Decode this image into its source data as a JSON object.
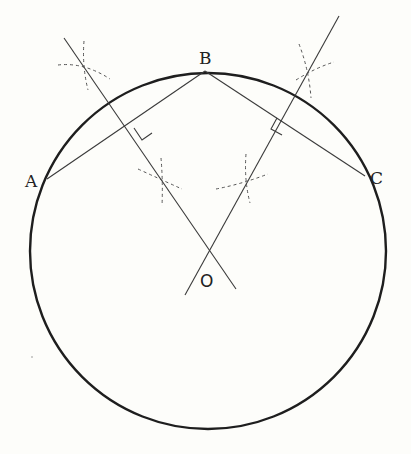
{
  "diagram": {
    "title": "",
    "background": "#fdfdfa",
    "stroke_color": "#2a2a2a",
    "circle": {
      "center": [
        208,
        251
      ],
      "radius": 178,
      "stroke_width": 2.4
    },
    "points": {
      "A": {
        "label": "A",
        "x": 47,
        "y": 179,
        "label_x": 25,
        "label_y": 187
      },
      "B": {
        "label": "B",
        "x": 205,
        "y": 71,
        "label_x": 199,
        "label_y": 64
      },
      "C": {
        "label": "C",
        "x": 365,
        "y": 176,
        "label_x": 371,
        "label_y": 184
      },
      "O": {
        "label": "O",
        "x": 208,
        "y": 250,
        "label_x": 200,
        "label_y": 287
      }
    },
    "chords": [
      {
        "name": "AB",
        "from": "A",
        "to": "B"
      },
      {
        "name": "BC",
        "from": "B",
        "to": "C"
      }
    ],
    "perpendicular_bisectors": [
      {
        "name": "bisector-AB",
        "x1": 64,
        "y1": 38,
        "x2": 236,
        "y2": 289
      },
      {
        "name": "bisector-BC",
        "x1": 339,
        "y1": 16,
        "x2": 185,
        "y2": 295
      }
    ],
    "right_angle_marks": [
      {
        "name": "right-angle-AB",
        "points": "134,128 142,140 152,133 144,121"
      },
      {
        "name": "right-angle-BC",
        "points": "277,118 271,129 282,135 288,124"
      }
    ],
    "construction_arcs_note": "dashed compass arcs crossing at bisector points"
  }
}
